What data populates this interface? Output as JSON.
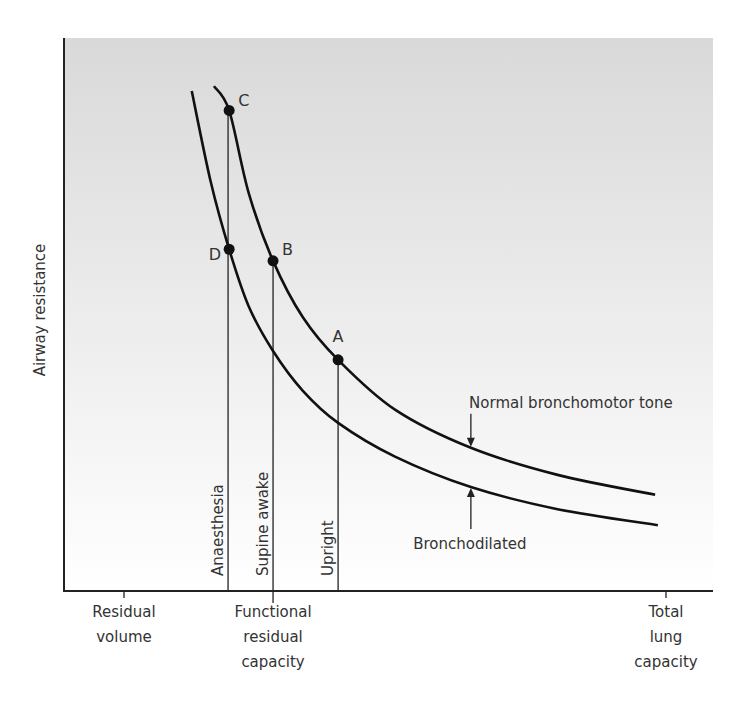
{
  "chart_data": {
    "type": "line",
    "title": "",
    "ylabel": "Airway resistance",
    "xlabel": "",
    "xlim": [
      -11,
      109
    ],
    "ylim": [
      0,
      100
    ],
    "grid": false,
    "background_gradient": [
      "#d9d9d9",
      "#ffffff"
    ],
    "x_ticks": [
      {
        "x": 0,
        "label": [
          "Residual",
          "volume"
        ]
      },
      {
        "x": 27.5,
        "label": [
          "Functional",
          "residual",
          "capacity"
        ]
      },
      {
        "x": 100,
        "label": [
          "Total",
          "lung",
          "capacity"
        ]
      }
    ],
    "series": [
      {
        "name": "Normal bronchomotor tone",
        "points": [
          [
            16.6,
            91.3
          ],
          [
            19.4,
            86.9
          ],
          [
            23.0,
            72.0
          ],
          [
            27.5,
            59.7
          ],
          [
            33.0,
            49.5
          ],
          [
            39.5,
            41.8
          ],
          [
            50.0,
            32.8
          ],
          [
            64.0,
            25.9
          ],
          [
            80.0,
            21.0
          ],
          [
            98.0,
            17.4
          ]
        ]
      },
      {
        "name": "Bronchodilated",
        "points": [
          [
            12.5,
            90.4
          ],
          [
            16.0,
            74.0
          ],
          [
            19.4,
            61.8
          ],
          [
            23.0,
            51.5
          ],
          [
            27.5,
            43.4
          ],
          [
            33.0,
            36.2
          ],
          [
            39.5,
            30.4
          ],
          [
            50.0,
            24.3
          ],
          [
            64.0,
            18.8
          ],
          [
            80.0,
            14.8
          ],
          [
            98.5,
            11.9
          ]
        ]
      }
    ],
    "marked_points": [
      {
        "label": "A",
        "x": 39.5,
        "y": 41.8,
        "series": "Normal bronchomotor tone"
      },
      {
        "label": "B",
        "x": 27.5,
        "y": 59.7,
        "series": "Normal bronchomotor tone"
      },
      {
        "label": "C",
        "x": 19.4,
        "y": 86.9,
        "series": "Normal bronchomotor tone"
      },
      {
        "label": "D",
        "x": 19.4,
        "y": 61.8,
        "series": "Bronchodilated"
      }
    ],
    "vertical_lines": [
      {
        "label": "Anaesthesia",
        "x": 19.2,
        "top": 86.9
      },
      {
        "label": "Supine awake",
        "x": 27.5,
        "top": 59.7
      },
      {
        "label": "Upright",
        "x": 39.5,
        "top": 41.8
      }
    ],
    "annotations": [
      {
        "text": "Normal bronchomotor tone",
        "arrow_to_series": "Normal bronchomotor tone",
        "x": 64.0,
        "direction": "down"
      },
      {
        "text": "Bronchodilated",
        "arrow_to_series": "Bronchodilated",
        "x": 64.0,
        "direction": "up"
      }
    ]
  }
}
